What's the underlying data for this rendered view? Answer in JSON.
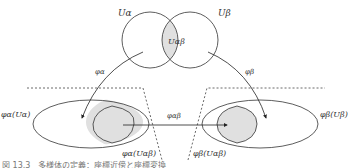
{
  "diagram": {
    "sets": {
      "u_alpha": "Uα",
      "u_beta": "Uβ",
      "u_alpha_beta": "Uαβ"
    },
    "maps": {
      "phi_alpha": "φα",
      "phi_beta": "φβ",
      "phi_alpha_beta": "φαβ"
    },
    "images": {
      "phi_alpha_u_alpha": "φα(Uα)",
      "phi_beta_u_beta": "φβ(Uβ)",
      "phi_alpha_u_alpha_beta": "φα(Uαβ)",
      "phi_beta_u_alpha_beta": "φβ(Uαβ)"
    },
    "colors": {
      "stroke": "#333333",
      "overlap_fill": "#e0e0e0",
      "dashed": "#444444"
    }
  },
  "caption": "図 13.3　多様体の定義：座標近傍と座標変換"
}
